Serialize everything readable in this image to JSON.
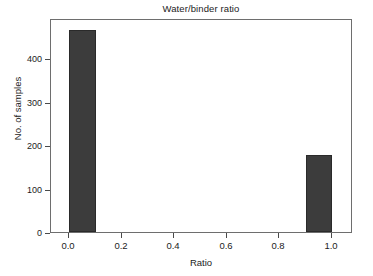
{
  "chart_data": {
    "type": "bar",
    "title": "Water/binder ratio",
    "xlabel": "Ratio",
    "ylabel": "No. of samples",
    "categories": [
      "0.0–0.1",
      "0.9–1.0"
    ],
    "bin_starts": [
      0.0,
      0.9
    ],
    "bin_width": 0.1,
    "values": [
      465,
      178
    ],
    "xlim": [
      -0.07,
      1.08
    ],
    "ylim": [
      0,
      492
    ],
    "xticks": [
      0.0,
      0.2,
      0.4,
      0.6,
      0.8,
      1.0
    ],
    "xticklabels": [
      "0.0",
      "0.2",
      "0.4",
      "0.6",
      "0.8",
      "1.0"
    ],
    "yticks": [
      0,
      100,
      200,
      300,
      400
    ],
    "yticklabels": [
      "0",
      "100",
      "200",
      "300",
      "400"
    ],
    "grid": false,
    "legend": null,
    "bar_color": "#3c3c3c",
    "frame_color": "#6e6e6e",
    "background": "#ffffff"
  },
  "axes": {
    "title": "Water/binder ratio",
    "x_axis_label": "Ratio",
    "y_axis_label": "No. of samples",
    "x_ticks": [
      {
        "value": 0.0,
        "label": "0.0"
      },
      {
        "value": 0.2,
        "label": "0.2"
      },
      {
        "value": 0.4,
        "label": "0.4"
      },
      {
        "value": 0.6,
        "label": "0.6"
      },
      {
        "value": 0.8,
        "label": "0.8"
      },
      {
        "value": 1.0,
        "label": "1.0"
      }
    ],
    "y_ticks": [
      {
        "value": 0,
        "label": "0"
      },
      {
        "value": 100,
        "label": "100"
      },
      {
        "value": 200,
        "label": "200"
      },
      {
        "value": 300,
        "label": "300"
      },
      {
        "value": 400,
        "label": "400"
      }
    ]
  },
  "bars": [
    {
      "name": "bar-low-ratio",
      "bin_start": 0.0,
      "bin_end": 0.1,
      "value": 465
    },
    {
      "name": "bar-high-ratio",
      "bin_start": 0.9,
      "bin_end": 1.0,
      "value": 178
    }
  ]
}
